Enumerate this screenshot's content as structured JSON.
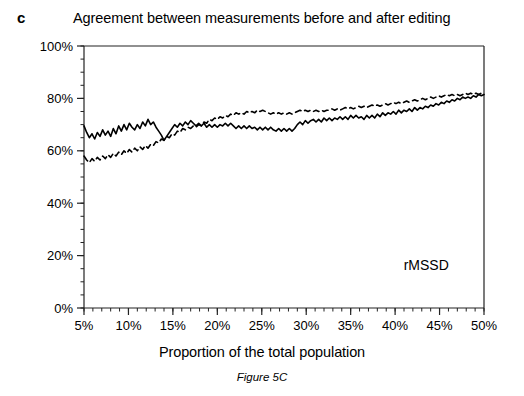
{
  "figure": {
    "panel_label": "c",
    "title": "Agreement between measurements before and after editing",
    "caption": "Figure 5C",
    "annotation": "rMSSD"
  },
  "chart_data": {
    "type": "line",
    "title": "Agreement between measurements before and after editing",
    "xlabel": "Proportion of the total population",
    "ylabel": "",
    "xlim": [
      5,
      50
    ],
    "ylim": [
      0,
      100
    ],
    "x_tick_labels": [
      "5%",
      "10%",
      "15%",
      "20%",
      "25%",
      "30%",
      "35%",
      "40%",
      "45%",
      "50%"
    ],
    "x_ticks": [
      5,
      10,
      15,
      20,
      25,
      30,
      35,
      40,
      45,
      50
    ],
    "x_minor_tick_step": 1,
    "y_tick_labels": [
      "0%",
      "20%",
      "40%",
      "60%",
      "80%",
      "100%"
    ],
    "y_ticks": [
      0,
      20,
      40,
      60,
      80,
      100
    ],
    "y_minor_tick_step": 5,
    "grid": false,
    "legend": "none",
    "annotations": [
      {
        "text": "rMSSD",
        "x": 43.5,
        "y": 14.5
      }
    ],
    "x": [
      5.0,
      5.3,
      5.6,
      5.9,
      6.2,
      6.5,
      6.8,
      7.1,
      7.4,
      7.7,
      8.0,
      8.3,
      8.6,
      8.9,
      9.2,
      9.5,
      9.8,
      10.1,
      10.4,
      10.7,
      11.0,
      11.3,
      11.6,
      11.9,
      12.2,
      12.5,
      12.8,
      13.1,
      13.4,
      13.7,
      14.0,
      14.3,
      14.6,
      14.9,
      15.2,
      15.5,
      15.8,
      16.1,
      16.4,
      16.7,
      17.0,
      17.3,
      17.6,
      17.9,
      18.2,
      18.5,
      18.8,
      19.1,
      19.4,
      19.7,
      20.0,
      20.3,
      20.6,
      20.9,
      21.2,
      21.5,
      21.8,
      22.1,
      22.4,
      22.7,
      23.0,
      23.3,
      23.6,
      23.9,
      24.2,
      24.5,
      24.8,
      25.1,
      25.4,
      25.7,
      26.0,
      26.3,
      26.6,
      26.9,
      27.2,
      27.5,
      27.8,
      28.1,
      28.4,
      28.7,
      29.0,
      29.3,
      29.6,
      29.9,
      30.2,
      30.5,
      30.8,
      31.1,
      31.4,
      31.7,
      32.0,
      32.3,
      32.6,
      32.9,
      33.2,
      33.5,
      33.8,
      34.1,
      34.4,
      34.7,
      35.0,
      35.3,
      35.6,
      35.9,
      36.2,
      36.5,
      36.8,
      37.1,
      37.4,
      37.7,
      38.0,
      38.3,
      38.6,
      38.9,
      39.2,
      39.5,
      39.8,
      40.1,
      40.4,
      40.7,
      41.0,
      41.3,
      41.6,
      41.9,
      42.2,
      42.5,
      42.8,
      43.1,
      43.4,
      43.7,
      44.0,
      44.3,
      44.6,
      44.9,
      45.2,
      45.5,
      45.8,
      46.1,
      46.4,
      46.7,
      47.0,
      47.3,
      47.6,
      47.9,
      48.2,
      48.5,
      48.8,
      49.1,
      49.4,
      49.7,
      50.0
    ],
    "series": [
      {
        "name": "before editing",
        "style": "solid",
        "color": "#000000",
        "values": [
          69.5,
          67.0,
          65.0,
          66.5,
          64.5,
          67.0,
          65.5,
          68.0,
          66.0,
          67.5,
          65.5,
          68.5,
          66.5,
          69.5,
          67.5,
          70.0,
          68.0,
          70.5,
          69.0,
          68.0,
          70.0,
          68.5,
          71.0,
          69.5,
          72.0,
          70.0,
          71.0,
          69.0,
          67.5,
          66.0,
          64.0,
          65.5,
          67.0,
          68.5,
          70.0,
          69.0,
          70.5,
          69.5,
          71.0,
          70.0,
          71.5,
          70.5,
          69.5,
          70.5,
          69.5,
          70.5,
          69.0,
          70.0,
          69.0,
          70.0,
          69.0,
          70.0,
          69.5,
          70.5,
          69.5,
          70.5,
          69.5,
          68.5,
          69.5,
          68.5,
          69.5,
          68.5,
          69.5,
          68.5,
          69.0,
          68.0,
          69.0,
          68.0,
          69.0,
          68.0,
          69.0,
          68.0,
          67.5,
          68.5,
          67.5,
          68.5,
          67.5,
          68.5,
          67.5,
          68.5,
          70.0,
          71.0,
          70.0,
          71.5,
          70.5,
          71.5,
          72.0,
          71.0,
          72.0,
          71.0,
          72.5,
          71.5,
          72.5,
          71.5,
          72.5,
          72.0,
          73.0,
          72.0,
          73.0,
          72.0,
          73.5,
          72.5,
          73.5,
          72.5,
          73.0,
          72.0,
          73.5,
          72.5,
          73.5,
          72.5,
          74.0,
          73.0,
          74.5,
          73.5,
          74.5,
          74.0,
          75.0,
          74.0,
          75.5,
          74.5,
          75.5,
          75.0,
          76.0,
          75.0,
          76.5,
          75.5,
          76.5,
          76.0,
          77.0,
          76.5,
          77.5,
          77.0,
          78.0,
          77.5,
          78.5,
          78.0,
          79.0,
          78.5,
          79.5,
          79.0,
          80.0,
          79.5,
          80.5,
          80.0,
          80.5,
          80.0,
          81.0,
          80.5,
          81.5,
          81.0,
          81.5
        ]
      },
      {
        "name": "after editing",
        "style": "dashed",
        "color": "#000000",
        "values": [
          58.0,
          56.5,
          55.5,
          57.0,
          56.0,
          57.5,
          56.5,
          58.0,
          57.0,
          58.5,
          57.5,
          59.0,
          58.0,
          59.5,
          58.5,
          60.0,
          59.0,
          60.5,
          59.5,
          61.0,
          60.0,
          61.5,
          60.5,
          62.0,
          61.0,
          62.5,
          62.0,
          63.5,
          63.0,
          64.5,
          64.0,
          65.5,
          65.0,
          66.5,
          66.0,
          67.5,
          67.0,
          68.5,
          68.0,
          69.0,
          68.5,
          69.5,
          69.0,
          70.0,
          69.5,
          71.0,
          70.5,
          72.0,
          71.5,
          72.5,
          72.0,
          73.0,
          72.5,
          73.5,
          73.0,
          74.0,
          73.5,
          74.5,
          74.0,
          74.5,
          74.0,
          75.0,
          74.5,
          75.0,
          74.5,
          75.5,
          75.0,
          75.5,
          75.0,
          74.5,
          74.0,
          74.5,
          74.0,
          74.5,
          74.0,
          74.5,
          74.0,
          74.5,
          74.0,
          74.5,
          75.0,
          75.5,
          75.0,
          75.5,
          75.0,
          75.5,
          75.0,
          75.5,
          75.0,
          75.5,
          75.0,
          75.5,
          75.5,
          76.0,
          75.5,
          76.0,
          75.5,
          76.0,
          76.5,
          76.0,
          76.5,
          76.0,
          76.5,
          77.0,
          76.5,
          77.0,
          76.5,
          77.0,
          77.5,
          77.0,
          77.5,
          77.0,
          77.5,
          78.0,
          77.5,
          78.0,
          78.5,
          78.0,
          78.5,
          78.0,
          78.5,
          79.0,
          78.5,
          79.0,
          79.5,
          79.0,
          79.5,
          80.0,
          79.5,
          80.0,
          80.5,
          80.0,
          80.5,
          81.0,
          80.5,
          81.0,
          81.5,
          81.0,
          81.5,
          81.0,
          81.5,
          81.0,
          81.5,
          82.0,
          81.5,
          82.0,
          81.5,
          82.0,
          81.5,
          82.0,
          81.5
        ]
      }
    ]
  }
}
